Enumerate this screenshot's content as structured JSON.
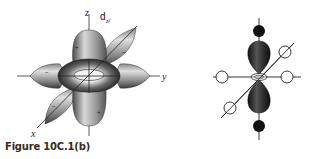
{
  "figure": {
    "caption": "Figure 10C.1(b)",
    "left_panel": {
      "orbital_label": "d",
      "orbital_subscript": "z²",
      "axes": {
        "x": "x",
        "y": "y",
        "z": "z"
      },
      "signs": {
        "top_lobe": "+",
        "bottom_lobe": "+",
        "left_lobe": "−",
        "right_lobe": "−",
        "diag_upper": "−",
        "diag_lower": "−"
      }
    },
    "right_panel": {
      "description": "d_z² orbital with octahedral ligands",
      "axial_ligands": "filled",
      "equatorial_ligands": "open"
    }
  }
}
